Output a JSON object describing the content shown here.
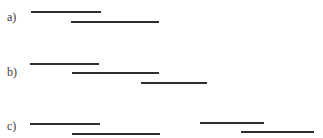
{
  "diagram": {
    "rows": [
      {
        "label": "a)",
        "label_pos": {
          "x": 7,
          "y": 11
        },
        "segments": [
          {
            "x1": 31,
            "x2": 101,
            "y": 12
          },
          {
            "x1": 71,
            "x2": 159,
            "y": 22
          }
        ]
      },
      {
        "label": "b)",
        "label_pos": {
          "x": 7,
          "y": 66
        },
        "segments": [
          {
            "x1": 30,
            "x2": 99,
            "y": 64
          },
          {
            "x1": 72,
            "x2": 159,
            "y": 73
          },
          {
            "x1": 141,
            "x2": 207,
            "y": 83
          }
        ]
      },
      {
        "label": "c)",
        "label_pos": {
          "x": 7,
          "y": 120
        },
        "segments": [
          {
            "x1": 30,
            "x2": 100,
            "y": 124
          },
          {
            "x1": 72,
            "x2": 160,
            "y": 134
          },
          {
            "x1": 200,
            "x2": 264,
            "y": 123
          },
          {
            "x1": 241,
            "x2": 314,
            "y": 132
          }
        ]
      }
    ],
    "colors": {
      "line": "#2f2f2f",
      "label": "#3a3a3a",
      "background": "#ffffff"
    }
  }
}
